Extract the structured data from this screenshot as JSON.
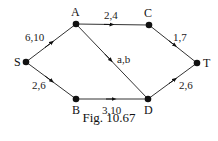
{
  "diagram": {
    "type": "flow-network",
    "nodes": [
      {
        "id": "S",
        "label": "S",
        "x": 26,
        "y": 62
      },
      {
        "id": "A",
        "label": "A",
        "x": 76,
        "y": 24
      },
      {
        "id": "C",
        "label": "C",
        "x": 149,
        "y": 25
      },
      {
        "id": "T",
        "label": "T",
        "x": 197,
        "y": 63
      },
      {
        "id": "B",
        "label": "B",
        "x": 76,
        "y": 99
      },
      {
        "id": "D",
        "label": "D",
        "x": 148,
        "y": 99
      }
    ],
    "edges": [
      {
        "from": "S",
        "to": "A",
        "label": "6,10"
      },
      {
        "from": "A",
        "to": "C",
        "label": "2,4"
      },
      {
        "from": "C",
        "to": "T",
        "label": "1,7"
      },
      {
        "from": "A",
        "to": "D",
        "label": "a,b"
      },
      {
        "from": "S",
        "to": "B",
        "label": "2,6"
      },
      {
        "from": "B",
        "to": "D",
        "label": "3,10"
      },
      {
        "from": "D",
        "to": "T",
        "label": "2,6"
      }
    ]
  },
  "caption": "Fig. 10.67"
}
